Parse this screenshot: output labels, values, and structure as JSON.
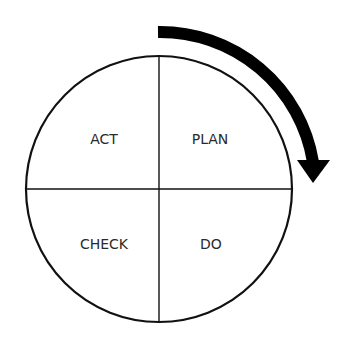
{
  "diagram": {
    "quadrants": [
      {
        "label": "PLAN",
        "position": "top-right"
      },
      {
        "label": "DO",
        "position": "bottom-right"
      },
      {
        "label": "CHECK",
        "position": "bottom-left"
      },
      {
        "label": "ACT",
        "position": "top-left"
      }
    ],
    "arrow": {
      "direction": "clockwise",
      "color": "#000000"
    },
    "colors": {
      "stroke": "#111111",
      "text": "#2a2a2a",
      "background": "#ffffff"
    }
  }
}
